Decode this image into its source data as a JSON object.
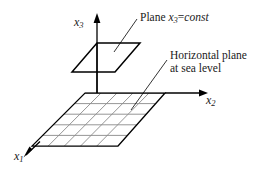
{
  "figure": {
    "name": "coordinate-system-with-constant-x3-plane",
    "background_color": "#ffffff",
    "line_color": "#000000",
    "grid_line_color": "#7a7a7a",
    "text_color": "#1a1a1a",
    "axes": [
      {
        "id": "x3",
        "base": "x",
        "subscript": "3",
        "direction": "up"
      },
      {
        "id": "x2",
        "base": "x",
        "subscript": "2",
        "direction": "right"
      },
      {
        "id": "x1",
        "base": "x",
        "subscript": "1",
        "direction": "down-left"
      }
    ],
    "annotations": [
      {
        "id": "plane-const",
        "prefix": "Plane",
        "variable_base": "x",
        "variable_subscript": "3",
        "equals": "=",
        "value": "const"
      },
      {
        "id": "horizontal-plane",
        "line1": "Horizontal plane",
        "line2": "at sea level"
      }
    ],
    "upper_plane": {
      "label": "plane x3 = const",
      "corners": [
        [
          97,
          43
        ],
        [
          140,
          43
        ],
        [
          115,
          72
        ],
        [
          72,
          72
        ]
      ]
    },
    "ground_plane": {
      "label": "horizontal plane at sea level",
      "corners": [
        [
          85,
          93
        ],
        [
          165,
          93
        ],
        [
          118,
          146
        ],
        [
          32,
          146
        ]
      ],
      "grid_columns": 5,
      "grid_rows": 5
    }
  }
}
